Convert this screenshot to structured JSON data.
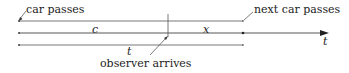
{
  "diagram": {
    "annotations": {
      "car_passes": "car passes",
      "next_car_passes": "next car passes",
      "observer_arrives": "observer arrives"
    },
    "segments": {
      "c": "c",
      "x": "x",
      "t": "t"
    },
    "axis_label": "t",
    "colors": {
      "line": "#444444",
      "text": "#222222"
    }
  }
}
